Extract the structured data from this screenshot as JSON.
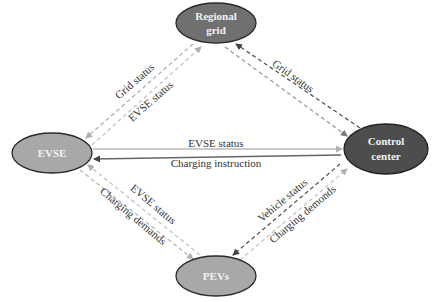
{
  "diagram": {
    "type": "communication-network",
    "nodes": [
      {
        "id": "regional_grid",
        "lines": [
          "Regional",
          "grid"
        ],
        "fill": "#6e6e6e"
      },
      {
        "id": "evse",
        "lines": [
          "EVSE"
        ],
        "fill": "#a6a6a6"
      },
      {
        "id": "control_center",
        "lines": [
          "Control",
          "center"
        ],
        "fill": "#4a4a4a"
      },
      {
        "id": "pevs",
        "lines": [
          "PEVs"
        ],
        "fill": "#a6a6a6"
      }
    ],
    "edges": [
      {
        "from": "regional_grid",
        "to": "evse",
        "label": "Grid status",
        "style": "dashed"
      },
      {
        "from": "evse",
        "to": "regional_grid",
        "label": "EVSE status",
        "style": "dashed"
      },
      {
        "from": "control_center",
        "to": "regional_grid",
        "label": "Grid status",
        "style": "dashed"
      },
      {
        "from": "regional_grid",
        "to": "control_center",
        "label": "",
        "style": "dashed"
      },
      {
        "from": "evse",
        "to": "control_center",
        "label": "EVSE status",
        "style": "solid"
      },
      {
        "from": "control_center",
        "to": "evse",
        "label": "Charging instruction",
        "style": "solid"
      },
      {
        "from": "pevs",
        "to": "evse",
        "label": "EVSE status",
        "style": "dashed"
      },
      {
        "from": "evse",
        "to": "pevs",
        "label": "Charging demands",
        "style": "dashed"
      },
      {
        "from": "control_center",
        "to": "pevs",
        "label": "Vehicle status",
        "style": "dashed"
      },
      {
        "from": "pevs",
        "to": "control_center",
        "label": "Charging demonds",
        "style": "dashed"
      }
    ]
  },
  "labels": {
    "regional_grid_line1": "Regional",
    "regional_grid_line2": "grid",
    "evse": "EVSE",
    "control_center_line1": "Control",
    "control_center_line2": "center",
    "pevs": "PEVs",
    "grid_status_left": "Grid status",
    "evse_status_left": "EVSE status",
    "grid_status_right": "Grid status",
    "evse_status_center": "EVSE status",
    "charging_instruction": "Charging instruction",
    "evse_status_lower": "EVSE status",
    "charging_demands_lower": "Charging demands",
    "vehicle_status": "Vehicle status",
    "charging_demonds": "Charging demonds"
  }
}
